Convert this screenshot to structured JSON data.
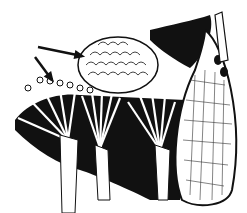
{
  "image": {
    "width": 247,
    "height": 213,
    "style": "black-and-white pen-and-ink anatomical illustration",
    "colors": {
      "ink": "#111111",
      "paper": "#ffffff"
    }
  },
  "illustration": {
    "subject": "cross-section showing a cauliflower-like mass resting on fan-shaped structures beside an elongated sac",
    "arrows": [
      {
        "name": "upper-arrow",
        "from": [
          38,
          47
        ],
        "to": [
          82,
          56
        ]
      },
      {
        "name": "lower-arrow",
        "from": [
          35,
          57
        ],
        "to": [
          52,
          80
        ]
      }
    ],
    "mass": {
      "cx": 118,
      "cy": 65,
      "rx": 40,
      "ry": 28
    },
    "granules": [
      [
        28,
        88
      ],
      [
        40,
        80
      ],
      [
        50,
        81
      ],
      [
        60,
        83
      ],
      [
        70,
        85
      ],
      [
        80,
        88
      ],
      [
        90,
        90
      ]
    ],
    "fans": [
      {
        "apex": [
          68,
          140
        ],
        "spread": [
          [
            18,
            118
          ],
          [
            30,
            100
          ],
          [
            45,
            92
          ],
          [
            60,
            90
          ],
          [
            75,
            92
          ]
        ]
      },
      {
        "apex": [
          100,
          148
        ],
        "spread": [
          [
            82,
            96
          ],
          [
            92,
            93
          ],
          [
            102,
            92
          ],
          [
            112,
            94
          ],
          [
            120,
            98
          ]
        ]
      },
      {
        "apex": [
          160,
          150
        ],
        "spread": [
          [
            128,
            102
          ],
          [
            140,
            96
          ],
          [
            152,
            94
          ],
          [
            165,
            96
          ],
          [
            175,
            102
          ]
        ]
      }
    ],
    "sac": {
      "path": "M205 30 C225 45 245 120 232 190 C228 205 200 210 182 200 C170 170 175 110 195 70 C200 55 205 40 205 30 Z"
    }
  }
}
